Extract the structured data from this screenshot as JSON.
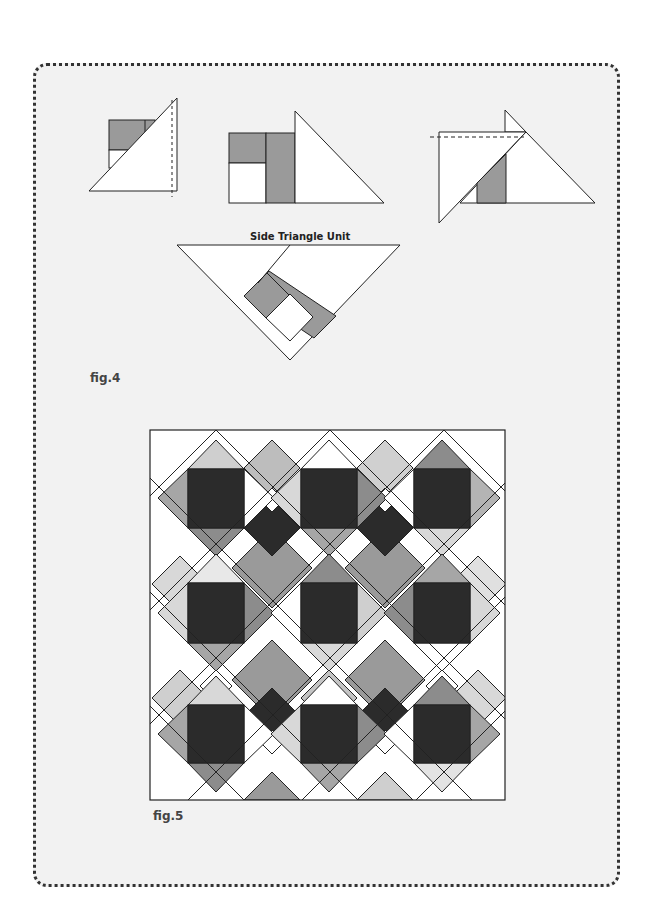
{
  "page": {
    "background": "#ffffff",
    "panel": {
      "border": "dotted",
      "fill": "#f2f2f2"
    }
  },
  "figure4": {
    "label": "fig.4",
    "unit_title": "Side Triangle Unit",
    "steps": [
      {
        "name": "step-1",
        "description": "square unit with overlaid triangle, dashed trim line at right"
      },
      {
        "name": "step-2",
        "description": "pieced rectangle unit with large triangle attached on right"
      },
      {
        "name": "step-3",
        "description": "triangle overlapping rectangle, dashed trim line at top"
      }
    ]
  },
  "figure5": {
    "label": "fig.5",
    "description": "Quilt layout: 3x3 on-point blocks with dark centers, gray triangles and pieced sashing"
  },
  "colors": {
    "dark": "#2b2b2b",
    "mid": "#8c8c8c",
    "midgray": "#a6a6a6",
    "light": "#cfcfcf",
    "pale": "#e3e3e3",
    "white": "#ffffff",
    "line": "#222222"
  }
}
